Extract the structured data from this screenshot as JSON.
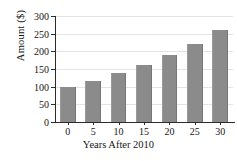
{
  "chart_data": {
    "type": "bar",
    "title": "",
    "xlabel": "Years After 2010",
    "ylabel": "Amount ($)",
    "categories": [
      "0",
      "5",
      "10",
      "15",
      "20",
      "25",
      "30"
    ],
    "values": [
      100,
      117,
      138,
      162,
      190,
      222,
      260
    ],
    "ylim": [
      0,
      300
    ],
    "yticks": [
      0,
      50,
      100,
      150,
      200,
      250,
      300
    ],
    "ytick_labels": [
      "0",
      "50",
      "100",
      "150",
      "200",
      "250",
      "300"
    ],
    "xtick_labels": [
      "0",
      "5",
      "10",
      "15",
      "20",
      "25",
      "30"
    ],
    "grid": true,
    "grid_axis": "y",
    "legend": false,
    "bar_color": "#8b8b8b",
    "axis_color": "#2b2b2b",
    "grid_color": "#e4e4e4",
    "background": "#ffffff"
  }
}
